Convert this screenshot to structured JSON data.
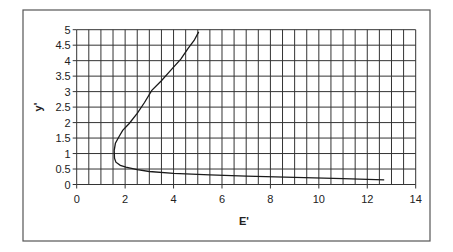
{
  "chart_data": {
    "type": "line",
    "title": "",
    "xlabel": "E'",
    "ylabel": "y'",
    "xlim": [
      0,
      14
    ],
    "ylim": [
      0,
      5
    ],
    "x_ticks": [
      0,
      2,
      4,
      6,
      8,
      10,
      12,
      14
    ],
    "y_ticks": [
      0,
      0.5,
      1,
      1.5,
      2,
      2.5,
      3,
      3.5,
      4,
      4.5,
      5
    ],
    "x_tick_labels": [
      "0",
      "2",
      "4",
      "6",
      "8",
      "10",
      "12",
      "14"
    ],
    "y_tick_labels": [
      "0",
      "0.5",
      "1",
      "1.5",
      "2",
      "2.5",
      "3",
      "3.5",
      "4",
      "4.5",
      "5"
    ],
    "grid": true,
    "x_grid_step": 0.5,
    "y_grid_step": 0.5,
    "legend": null,
    "series": [
      {
        "name": "specific energy curve",
        "color": "#1a1a1a",
        "x": [
          12.7,
          11.0,
          9.0,
          7.0,
          5.5,
          4.0,
          3.0,
          2.5,
          2.03,
          1.8,
          1.62,
          1.56,
          1.55,
          1.6,
          1.75,
          1.9,
          2.17,
          2.5,
          2.8,
          3.1,
          3.5,
          3.9,
          4.3,
          4.6,
          4.85,
          5.04
        ],
        "values": [
          0.15,
          0.19,
          0.23,
          0.27,
          0.31,
          0.36,
          0.42,
          0.48,
          0.56,
          0.62,
          0.72,
          0.85,
          1.1,
          1.33,
          1.55,
          1.75,
          1.97,
          2.3,
          2.65,
          3.04,
          3.35,
          3.7,
          4.05,
          4.4,
          4.65,
          4.93
        ]
      }
    ]
  },
  "frame": {
    "border_color": "#555555"
  },
  "grid_color": "#333333"
}
